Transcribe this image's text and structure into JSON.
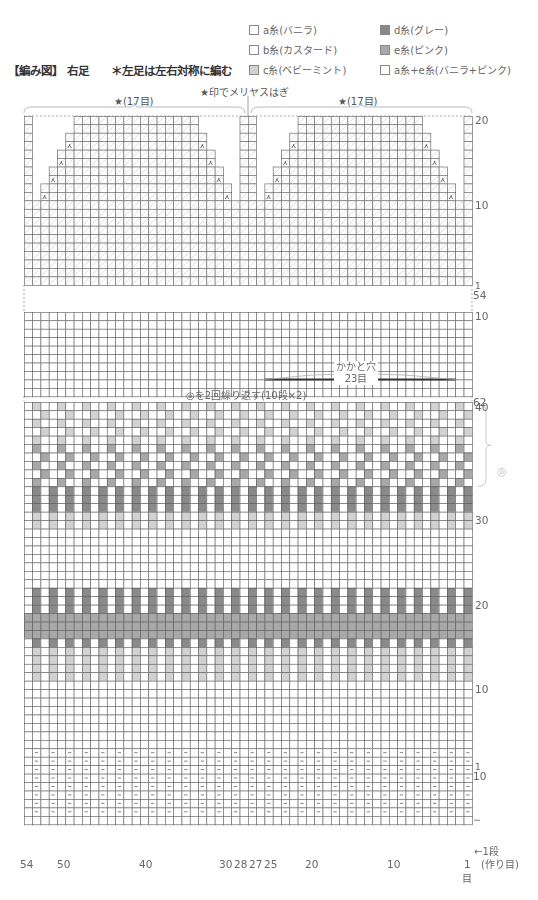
{
  "header": {
    "title": "【編み図】 右足",
    "note": "＊左足は左右対称に編む"
  },
  "legend": {
    "items": [
      {
        "label": "a糸(バニラ)",
        "color": "#ffffff"
      },
      {
        "label": "b糸(カスタード)",
        "color": "#ffffff"
      },
      {
        "label": "c糸(ベビーミント)",
        "color": "#d2d2d2"
      },
      {
        "label": "d糸(グレー)",
        "color": "#8a8a8a"
      },
      {
        "label": "e糸(ピンク)",
        "color": "#a8a8a8"
      },
      {
        "label": "a糸+e糸(バニラ+ピンク)",
        "color": "#ffffff"
      }
    ]
  },
  "annotations": {
    "graft_note": "★印でメリヤスはぎ",
    "left_star": "★(17目)",
    "right_star": "★(17目)",
    "heel_hole_line1": "かかと穴",
    "heel_hole_line2": "23目",
    "repeat_note": "◎を2回繰り返す(10段×2)",
    "repeat_symbol": "◎",
    "first_row": "←1段",
    "cast_on": "(作り目)",
    "stitch_unit": "目"
  },
  "row_labels": {
    "toe": [
      "20",
      "10",
      "1",
      "54"
    ],
    "heel": [
      "10",
      "1",
      "62"
    ],
    "colorwork": [
      "40",
      "30",
      "20",
      "10",
      "1",
      "10"
    ]
  },
  "column_labels": [
    "54",
    "50",
    "40",
    "30",
    "28",
    "27",
    "25",
    "20",
    "10",
    "1"
  ],
  "chart_data": {
    "type": "table",
    "stitches": 54,
    "sections": [
      {
        "name": "toe",
        "rows": 20,
        "decrease_rows": [
          12,
          14,
          16,
          18
        ],
        "hatched": true
      },
      {
        "name": "heel",
        "rows": 10,
        "heel_hole_stitches": 23,
        "heel_hole_columns": [
          3,
          25
        ]
      },
      {
        "name": "colorwork",
        "rows": 40,
        "repeat": "rows 31-40 x2"
      },
      {
        "name": "ribbing",
        "rows": 10,
        "purl_marks": "every other stitch"
      }
    ],
    "colorwork_rows_top_to_bottom": [
      "c:alt3",
      "c:alt3s",
      "c:alt3",
      "c:alt3s",
      "c:alt3",
      "e:alt3",
      "e:alt3s",
      "e:alt3",
      "e:alt3s",
      "e:alt3",
      "d:alt2",
      "d:alt2",
      "d:alt2",
      "c:altB",
      "c:altB",
      "w",
      "w",
      "w",
      "w",
      "w",
      "w",
      "w",
      "d:alt2",
      "d:alt2",
      "d:alt2",
      "e:full",
      "e:full",
      "e:full",
      "d:alt2",
      "c:alt2",
      "c:alt2",
      "c:alt2",
      "c:alt2",
      "w",
      "w",
      "w",
      "w",
      "w",
      "w",
      "w"
    ]
  }
}
